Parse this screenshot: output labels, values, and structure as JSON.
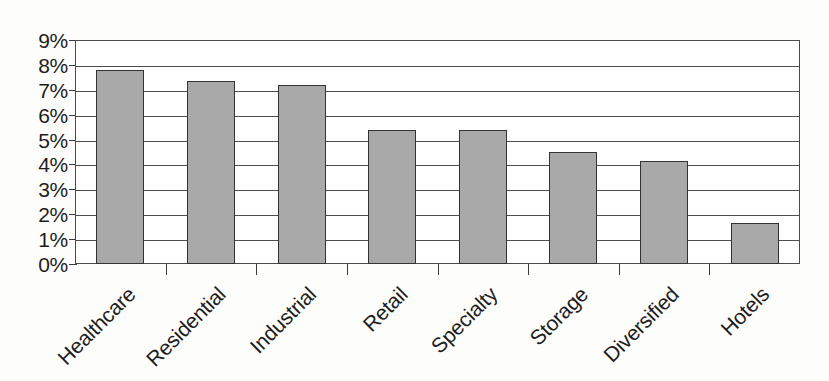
{
  "chart_data": {
    "type": "bar",
    "title": "",
    "subtitle": "",
    "xlabel": "",
    "ylabel": "",
    "categories": [
      "Healthcare",
      "Residential",
      "Industrial",
      "Retail",
      "Specialty",
      "Storage",
      "Diversified",
      "Hotels"
    ],
    "values": [
      7.8,
      7.35,
      7.2,
      5.4,
      5.4,
      4.5,
      4.15,
      1.65
    ],
    "value_suffix": "%",
    "ylim": [
      0,
      9
    ],
    "y_tick_labels": [
      "9%",
      "8%",
      "7%",
      "6%",
      "5%",
      "4%",
      "3%",
      "2%",
      "1%",
      "0%"
    ],
    "y_tick_values": [
      9,
      8,
      7,
      6,
      5,
      4,
      3,
      2,
      1,
      0
    ],
    "grid": true,
    "grid_axis": "y",
    "legend": false,
    "legend_position": "none",
    "bar_color": "#a9a9a9",
    "bar_border_color": "#333333",
    "axis_color": "#4a4a4a",
    "background_color": "#fdfdfc",
    "x_tick_label_rotation": -45,
    "annotations": []
  }
}
